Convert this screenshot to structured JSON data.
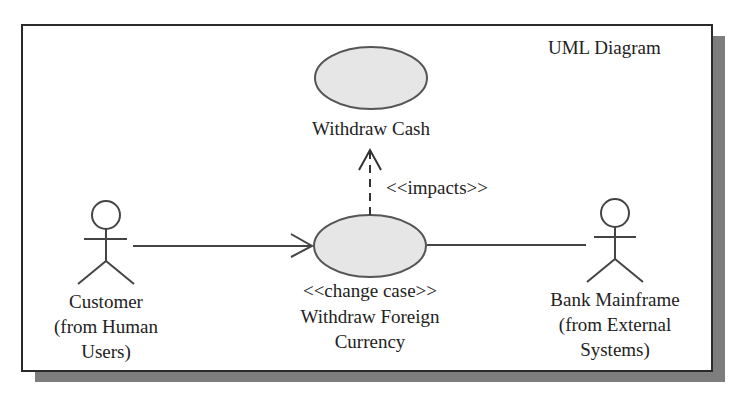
{
  "diagram": {
    "title": "UML Diagram",
    "type": "use-case",
    "colors": {
      "frame_border": "#2a2a2a",
      "shadow": "#7d7d7d",
      "use_case_fill": "#e6e6e6",
      "line": "#444444"
    },
    "use_cases": [
      {
        "id": "withdraw-cash",
        "label": "Withdraw Cash"
      },
      {
        "id": "withdraw-foreign-currency",
        "stereotype": "<<change case>>",
        "label_line1": "Withdraw Foreign",
        "label_line2": "Currency"
      }
    ],
    "actors": [
      {
        "id": "customer",
        "line1": "Customer",
        "line2": "(from Human",
        "line3": "Users)"
      },
      {
        "id": "bank-mainframe",
        "line1": "Bank Mainframe",
        "line2": "(from External",
        "line3": "Systems)"
      }
    ],
    "relationships": [
      {
        "from": "customer",
        "to": "withdraw-foreign-currency",
        "kind": "association-arrow"
      },
      {
        "from": "withdraw-foreign-currency",
        "to": "bank-mainframe",
        "kind": "association"
      },
      {
        "from": "withdraw-foreign-currency",
        "to": "withdraw-cash",
        "kind": "dependency",
        "label": "<<impacts>>"
      }
    ]
  }
}
